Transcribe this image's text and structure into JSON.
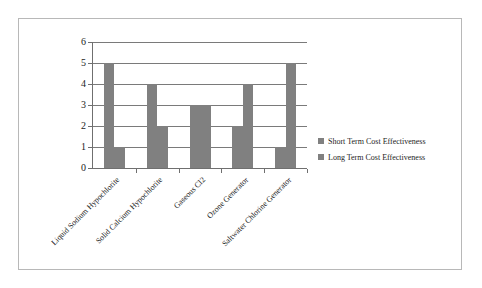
{
  "chart_data": {
    "type": "bar",
    "title": "",
    "subtitle": "",
    "xlabel": "",
    "ylabel": "",
    "ylim": [
      0,
      6
    ],
    "ytick_step": 1,
    "yticks": [
      "0",
      "1",
      "2",
      "3",
      "4",
      "5",
      "6"
    ],
    "grid": true,
    "legend_position": "right",
    "bar_color": "#808080",
    "axis_color": "#6f6f6f",
    "grid_color": "#7a7a7a",
    "categories": [
      "Liquid Sodium Hypochlorite",
      "Solid Calcium Hypochlorite",
      "Gaseous Cl2",
      "Ozone Generator",
      "Saltwater Chlorine Generator"
    ],
    "series": [
      {
        "name": "Short Term Cost Effectiveness",
        "color": "#808080",
        "values": [
          5,
          4,
          3,
          2,
          1
        ]
      },
      {
        "name": "Long Term Cost Effectiveness",
        "color": "#808080",
        "values": [
          1,
          2,
          3,
          4,
          5
        ]
      }
    ]
  },
  "legend": {
    "items": [
      {
        "label": "Short Term Cost Effectiveness",
        "color": "#808080"
      },
      {
        "label": "Long Term Cost Effectiveness",
        "color": "#808080"
      }
    ]
  }
}
